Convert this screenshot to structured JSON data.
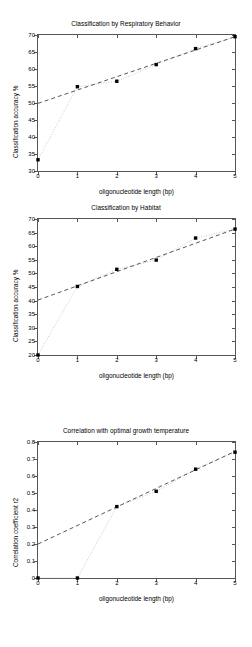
{
  "figures": [
    {
      "title": "Classification by Respiratory Behavior",
      "xlabel": "oligonucleotide length (bp)",
      "ylabel": "Classification accuracy %"
    },
    {
      "title": "Classification by Habitat",
      "xlabel": "oligonucleotide length (bp)",
      "ylabel": "Classification accuracy %"
    },
    {
      "title": "Correlation with optimal growth temperature",
      "xlabel": "oligonucleotide length (bp)",
      "ylabel": "Correlation coefficient r2"
    }
  ],
  "chart_data": [
    {
      "type": "scatter",
      "title": "Classification by Respiratory Behavior",
      "xlabel": "oligonucleotide length (bp)",
      "ylabel": "Classification accuracy %",
      "xlim": [
        0,
        5
      ],
      "ylim": [
        30,
        70
      ],
      "xticks": [
        0,
        1,
        2,
        3,
        4,
        5
      ],
      "yticks": [
        30,
        35,
        40,
        45,
        50,
        55,
        60,
        65,
        70
      ],
      "xticklabels": [
        "0",
        "1",
        "2",
        "3",
        "4",
        "5"
      ],
      "yticklabels": [
        "30",
        "35",
        "40",
        "45",
        "50",
        "55",
        "60",
        "65",
        "70"
      ],
      "grid": false,
      "legend": false,
      "series": [
        {
          "name": "measured accuracy",
          "style": "dotted-line-with-square-markers",
          "marker": "square",
          "x": [
            0,
            1,
            2,
            3,
            4,
            5
          ],
          "values": [
            33.3,
            54.8,
            56.4,
            61.3,
            66.0,
            69.5
          ]
        },
        {
          "name": "linear fit",
          "style": "dashed",
          "marker": "none",
          "x": [
            0,
            5
          ],
          "values": [
            49.9,
            69.5
          ]
        }
      ]
    },
    {
      "type": "scatter",
      "title": "Classification by Habitat",
      "xlabel": "oligonucleotide length (bp)",
      "ylabel": "Classification accuracy %",
      "xlim": [
        0,
        5
      ],
      "ylim": [
        20,
        70
      ],
      "xticks": [
        0,
        1,
        2,
        3,
        4,
        5
      ],
      "yticks": [
        20,
        25,
        30,
        35,
        40,
        45,
        50,
        55,
        60,
        65,
        70
      ],
      "xticklabels": [
        "0",
        "1",
        "2",
        "3",
        "4",
        "5"
      ],
      "yticklabels": [
        "20",
        "25",
        "30",
        "35",
        "40",
        "45",
        "50",
        "55",
        "60",
        "65",
        "70"
      ],
      "grid": false,
      "legend": false,
      "series": [
        {
          "name": "measured accuracy",
          "style": "dotted-line-with-square-markers",
          "marker": "square",
          "x": [
            0,
            1,
            2,
            3,
            4,
            5
          ],
          "values": [
            20.0,
            45.2,
            51.5,
            54.9,
            63.0,
            66.3
          ]
        },
        {
          "name": "linear fit",
          "style": "dashed",
          "marker": "none",
          "x": [
            0,
            5
          ],
          "values": [
            40.2,
            66.3
          ]
        }
      ]
    },
    {
      "type": "scatter",
      "title": "Correlation with optimal growth temperature",
      "xlabel": "oligonucleotide length (bp)",
      "ylabel": "Correlation coefficient r2",
      "xlim": [
        0,
        5
      ],
      "ylim": [
        0,
        0.8
      ],
      "xticks": [
        0,
        1,
        2,
        3,
        4,
        5
      ],
      "yticks": [
        0,
        0.1,
        0.2,
        0.3,
        0.4,
        0.5,
        0.6,
        0.7,
        0.8
      ],
      "xticklabels": [
        "0",
        "1",
        "2",
        "3",
        "4",
        "5"
      ],
      "yticklabels": [
        "0",
        "0.1",
        "0.2",
        "0.3",
        "0.4",
        "0.5",
        "0.6",
        "0.7",
        "0.8"
      ],
      "grid": false,
      "legend": false,
      "series": [
        {
          "name": "measured correlation",
          "style": "dotted-line-with-square-markers",
          "marker": "square",
          "x": [
            0,
            1,
            2,
            3,
            4,
            5
          ],
          "values": [
            0.0,
            0.0,
            0.42,
            0.51,
            0.64,
            0.74
          ]
        },
        {
          "name": "linear fit",
          "style": "dashed",
          "marker": "none",
          "x": [
            0,
            5
          ],
          "values": [
            0.2,
            0.745
          ]
        }
      ]
    }
  ],
  "colors": {
    "axis": "#555555",
    "marker": "#000000",
    "fit_line": "#444444",
    "data_line": "#bbbbbb",
    "background": "#ffffff"
  }
}
